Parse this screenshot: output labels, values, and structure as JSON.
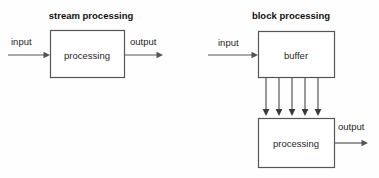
{
  "figure": {
    "background_color": "#fefefe",
    "stroke_color": "#555555",
    "text_color": "#1f1f1f"
  },
  "panels": {
    "stream": {
      "title": "stream processing",
      "input_label": "input",
      "output_label": "output",
      "box_label": "processing"
    },
    "block": {
      "title": "block processing",
      "input_label": "input",
      "output_label": "output",
      "buffer_label": "buffer",
      "processing_label": "processing",
      "parallel_arrow_count": 5
    }
  }
}
